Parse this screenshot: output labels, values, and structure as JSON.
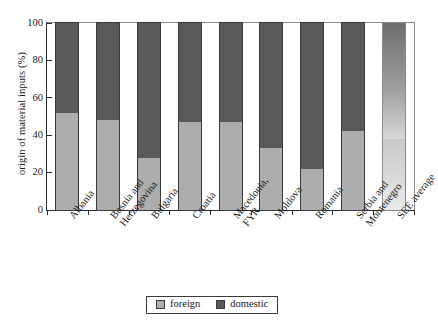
{
  "chart_data": {
    "type": "bar",
    "subtype": "stacked-100-percent",
    "title": "",
    "xlabel": "",
    "ylabel": "origin of material inputs (%)",
    "ylim": [
      0,
      100
    ],
    "yticks": [
      0,
      20,
      40,
      60,
      80,
      100
    ],
    "ytick_labels": [
      "0",
      "20",
      "40",
      "60",
      "80",
      "100"
    ],
    "grid": false,
    "legend_position": "bottom-center",
    "categories": [
      "Albania",
      "Bosnia and Herzegovina",
      "Bulgaria",
      "Croatia",
      "Macedonia, FYR",
      "Moldova",
      "Romania",
      "Serbia and Montenegro",
      "SEE average"
    ],
    "category_lines": [
      [
        "Albania"
      ],
      [
        "Bosnia and",
        "Herzegovina"
      ],
      [
        "Bulgaria"
      ],
      [
        "Croatia"
      ],
      [
        "Macedonia,",
        "FYR"
      ],
      [
        "Moldova"
      ],
      [
        "Romania"
      ],
      [
        "Serbia and",
        "Montenegro"
      ],
      [
        "SEE average"
      ]
    ],
    "series": [
      {
        "name": "foreign",
        "color": "#adadad",
        "values": [
          52,
          48,
          28,
          47,
          47,
          33,
          22,
          42,
          38
        ]
      },
      {
        "name": "domestic",
        "color": "#595959",
        "values": [
          48,
          52,
          72,
          53,
          53,
          67,
          78,
          58,
          62
        ]
      }
    ]
  },
  "legend": {
    "items": [
      {
        "label": "foreign",
        "color": "#adadad"
      },
      {
        "label": "domestic",
        "color": "#595959"
      }
    ]
  }
}
